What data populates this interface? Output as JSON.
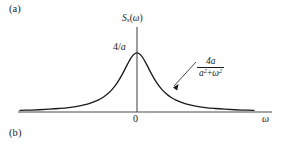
{
  "figure": {
    "panel_tag_top": "(a)",
    "panel_tag_bottom": "(b)",
    "background_color": "#ffffff",
    "curve_color": "#1a1a1a",
    "axis_color": "#4d4d4d"
  },
  "axes": {
    "y_title_symbol": "S",
    "y_title_subscript": "x",
    "y_title_arg_open": "(",
    "y_title_arg": "ω",
    "y_title_arg_close": ")",
    "x_title": "ω",
    "origin_label": "0",
    "peak_label": "4/",
    "peak_label_italic": "a"
  },
  "annotation": {
    "numerator": "4a",
    "denominator_a": "a",
    "denominator_exp1": "2",
    "denominator_op": "+",
    "denominator_w": "ω",
    "denominator_exp2": "2",
    "pointer": "arrow-to-curve"
  },
  "chart_data": {
    "type": "line",
    "title": "",
    "subtitle": "",
    "xlabel": "ω",
    "ylabel": "Sₓ(ω)",
    "function": "4a / (a^2 + ω^2)",
    "peak_value_label": "4/a",
    "peak_x": 0,
    "grid": false,
    "legend": null,
    "xlim": [
      -6,
      6
    ],
    "ylim": [
      0,
      1.18
    ],
    "x_tick_labels": [
      "0"
    ],
    "x_tick_values": [
      0
    ],
    "y_tick_labels": [
      "4/a"
    ],
    "y_tick_values": [
      1
    ],
    "annotations": [
      {
        "text": "4a/(a²+ω²)",
        "points_to_x": 1.45,
        "points_to_y": 0.32
      }
    ],
    "x": [
      -6,
      -5.5,
      -5,
      -4.5,
      -4,
      -3.5,
      -3,
      -2.5,
      -2,
      -1.75,
      -1.5,
      -1.25,
      -1,
      -0.75,
      -0.5,
      -0.25,
      0,
      0.25,
      0.5,
      0.75,
      1,
      1.25,
      1.5,
      1.75,
      2,
      2.5,
      3,
      3.5,
      4,
      4.5,
      5,
      5.5,
      6
    ],
    "y": [
      0.027,
      0.032,
      0.038,
      0.047,
      0.059,
      0.075,
      0.1,
      0.138,
      0.2,
      0.246,
      0.308,
      0.39,
      0.5,
      0.64,
      0.8,
      0.941,
      1.0,
      0.941,
      0.8,
      0.64,
      0.5,
      0.39,
      0.308,
      0.246,
      0.2,
      0.138,
      0.1,
      0.075,
      0.059,
      0.047,
      0.038,
      0.032,
      0.027
    ]
  }
}
